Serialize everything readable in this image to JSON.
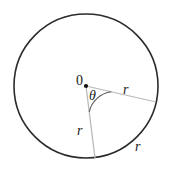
{
  "figure": {
    "kind": "geometry-diagram",
    "background_color": "#ffffff",
    "canvas": {
      "width": 170,
      "height": 172
    }
  },
  "circle": {
    "center_x": 86,
    "center_y": 86,
    "radius": 72,
    "stroke_color": "#2b2b2b",
    "stroke_width": 1.6,
    "fill": "none"
  },
  "center_point": {
    "x": 86,
    "y": 86,
    "radius": 2.1,
    "color": "#111111"
  },
  "radii": [
    {
      "name": "upper-radius",
      "label": "r",
      "from_x": 86,
      "from_y": 86,
      "to_x": 156,
      "to_y": 102,
      "stroke_color": "#b9b9b9",
      "stroke_width": 1.2
    },
    {
      "name": "lower-radius",
      "label": "r",
      "from_x": 86,
      "from_y": 86,
      "to_x": 95,
      "to_y": 158,
      "stroke_color": "#b9b9b9",
      "stroke_width": 1.2
    }
  ],
  "angle_arc": {
    "label": "θ",
    "radius": 26,
    "stroke_color": "#5a5a5a",
    "stroke_width": 1.1,
    "path": "M 111.4 91.8 A 26 26 0 0 0 89.2 111.8"
  },
  "labels": {
    "center": "0",
    "theta": "θ",
    "r_upper": "r",
    "r_lower": "r",
    "r_arc": "r"
  }
}
